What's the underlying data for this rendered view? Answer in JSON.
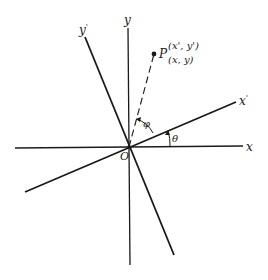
{
  "diagram": {
    "type": "rotated-coordinate-axes",
    "axes": {
      "x": "x",
      "y": "y",
      "x_prime": "x",
      "y_prime": "y",
      "prime_mark": "'"
    },
    "origin_label": "O",
    "point": {
      "label": "P",
      "rotated_coords": "(x', y')",
      "original_coords": "(x, y)"
    },
    "angles": {
      "theta": "θ",
      "phi": "φ"
    },
    "colors": {
      "line": "#1a1a1a",
      "background": "#ffffff"
    }
  }
}
